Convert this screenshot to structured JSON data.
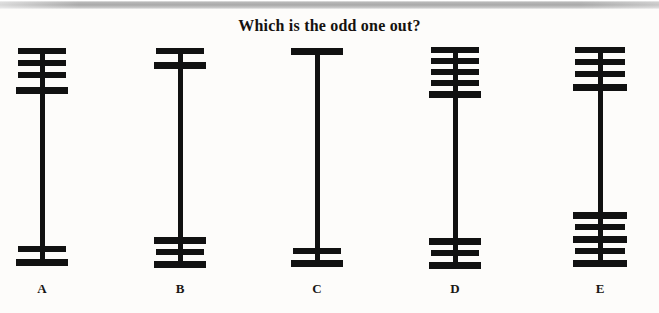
{
  "page": {
    "title": "Which is the odd one out?",
    "background_color": "#fdfcfa",
    "ink_color": "#111111",
    "width": 659,
    "height": 313,
    "scan_edge_color": "#adadad"
  },
  "puzzle": {
    "prompt": "Which is the odd one out?",
    "type": "visual-analogy-odd-one-out",
    "option_labels": [
      "A",
      "B",
      "C",
      "D",
      "E"
    ]
  },
  "figures": [
    {
      "label": "A",
      "label_x": 42,
      "center_x": 42,
      "stem": {
        "x": 40,
        "y_top": 48,
        "y_bottom": 262,
        "width": 5
      },
      "top_bar_count": 4,
      "bottom_bar_count": 2,
      "total_bars": 6,
      "bars": [
        {
          "cx": 42,
          "y": 48,
          "half_width": 24,
          "thickness": 6
        },
        {
          "cx": 42,
          "y": 60,
          "half_width": 24,
          "thickness": 6
        },
        {
          "cx": 42,
          "y": 72,
          "half_width": 24,
          "thickness": 6
        },
        {
          "cx": 42,
          "y": 87,
          "half_width": 26,
          "thickness": 7
        },
        {
          "cx": 42,
          "y": 246,
          "half_width": 24,
          "thickness": 6
        },
        {
          "cx": 42,
          "y": 259,
          "half_width": 26,
          "thickness": 7
        }
      ]
    },
    {
      "label": "B",
      "label_x": 180,
      "center_x": 180,
      "stem": {
        "x": 178,
        "y_top": 48,
        "y_bottom": 264,
        "width": 5
      },
      "top_bar_count": 2,
      "bottom_bar_count": 3,
      "total_bars": 5,
      "bars": [
        {
          "cx": 180,
          "y": 48,
          "half_width": 24,
          "thickness": 6
        },
        {
          "cx": 180,
          "y": 62,
          "half_width": 26,
          "thickness": 7
        },
        {
          "cx": 180,
          "y": 237,
          "half_width": 26,
          "thickness": 7
        },
        {
          "cx": 180,
          "y": 249,
          "half_width": 24,
          "thickness": 6
        },
        {
          "cx": 180,
          "y": 261,
          "half_width": 26,
          "thickness": 7
        }
      ]
    },
    {
      "label": "C",
      "label_x": 317,
      "center_x": 317,
      "stem": {
        "x": 315,
        "y_top": 48,
        "y_bottom": 263,
        "width": 5
      },
      "top_bar_count": 1,
      "bottom_bar_count": 2,
      "total_bars": 3,
      "bars": [
        {
          "cx": 317,
          "y": 48,
          "half_width": 26,
          "thickness": 7
        },
        {
          "cx": 317,
          "y": 248,
          "half_width": 24,
          "thickness": 6
        },
        {
          "cx": 317,
          "y": 260,
          "half_width": 26,
          "thickness": 7
        }
      ]
    },
    {
      "label": "D",
      "label_x": 455,
      "center_x": 455,
      "stem": {
        "x": 453,
        "y_top": 47,
        "y_bottom": 264,
        "width": 5
      },
      "top_bar_count": 5,
      "bottom_bar_count": 3,
      "total_bars": 8,
      "bars": [
        {
          "cx": 455,
          "y": 47,
          "half_width": 24,
          "thickness": 6
        },
        {
          "cx": 455,
          "y": 58,
          "half_width": 24,
          "thickness": 6
        },
        {
          "cx": 455,
          "y": 69,
          "half_width": 24,
          "thickness": 6
        },
        {
          "cx": 455,
          "y": 80,
          "half_width": 24,
          "thickness": 6
        },
        {
          "cx": 455,
          "y": 91,
          "half_width": 26,
          "thickness": 7
        },
        {
          "cx": 455,
          "y": 238,
          "half_width": 26,
          "thickness": 7
        },
        {
          "cx": 455,
          "y": 250,
          "half_width": 24,
          "thickness": 6
        },
        {
          "cx": 455,
          "y": 262,
          "half_width": 26,
          "thickness": 7
        }
      ]
    },
    {
      "label": "E",
      "label_x": 600,
      "center_x": 600,
      "stem": {
        "x": 598,
        "y_top": 47,
        "y_bottom": 262,
        "width": 5
      },
      "top_bar_count": 4,
      "bottom_bar_count": 5,
      "total_bars": 9,
      "bars": [
        {
          "cx": 600,
          "y": 47,
          "half_width": 25,
          "thickness": 6
        },
        {
          "cx": 600,
          "y": 59,
          "half_width": 25,
          "thickness": 6
        },
        {
          "cx": 600,
          "y": 71,
          "half_width": 25,
          "thickness": 6
        },
        {
          "cx": 600,
          "y": 84,
          "half_width": 27,
          "thickness": 7
        },
        {
          "cx": 600,
          "y": 212,
          "half_width": 27,
          "thickness": 7
        },
        {
          "cx": 600,
          "y": 224,
          "half_width": 25,
          "thickness": 6
        },
        {
          "cx": 600,
          "y": 236,
          "half_width": 27,
          "thickness": 7
        },
        {
          "cx": 600,
          "y": 248,
          "half_width": 25,
          "thickness": 6
        },
        {
          "cx": 600,
          "y": 260,
          "half_width": 27,
          "thickness": 7
        }
      ]
    }
  ]
}
